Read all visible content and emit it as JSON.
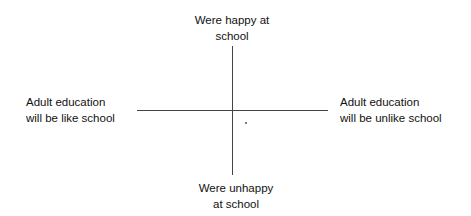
{
  "diagram": {
    "type": "quadrant",
    "top_label_line1": "Were happy at",
    "top_label_line2": "school",
    "bottom_label_line1": "Were unhappy",
    "bottom_label_line2": "at school",
    "left_label_line1": "Adult education",
    "left_label_line2": "will be like school",
    "right_label_line1": "Adult education",
    "right_label_line2": "will be unlike school"
  }
}
